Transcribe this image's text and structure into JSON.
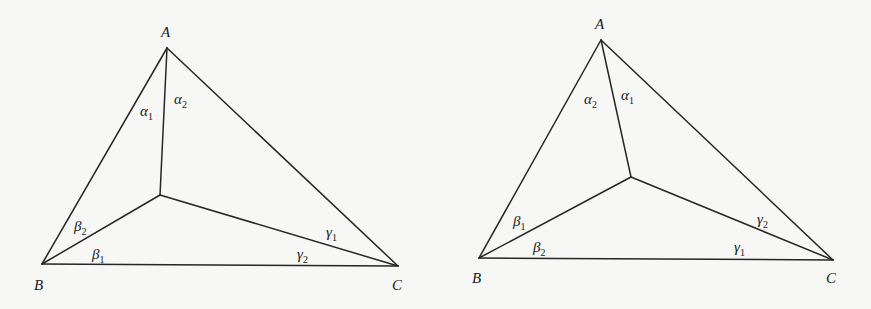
{
  "figures": [
    {
      "id": "left",
      "vertices": {
        "A": {
          "label": "A",
          "x": 167,
          "y": 48
        },
        "B": {
          "label": "B",
          "x": 42,
          "y": 264
        },
        "C": {
          "label": "C",
          "x": 398,
          "y": 266
        }
      },
      "interior_point": {
        "x": 160,
        "y": 195
      },
      "angles": [
        {
          "sym": "α",
          "sub": "1",
          "x": 140,
          "y": 116
        },
        {
          "sym": "α",
          "sub": "2",
          "x": 174,
          "y": 104
        },
        {
          "sym": "β",
          "sub": "2",
          "x": 74,
          "y": 231
        },
        {
          "sym": "β",
          "sub": "1",
          "x": 92,
          "y": 259
        },
        {
          "sym": "γ",
          "sub": "1",
          "x": 326,
          "y": 237
        },
        {
          "sym": "γ",
          "sub": "2",
          "x": 297,
          "y": 259
        }
      ],
      "vertex_label_pos": {
        "A": {
          "x": 161,
          "y": 37
        },
        "B": {
          "x": 34,
          "y": 290
        },
        "C": {
          "x": 392,
          "y": 290
        }
      }
    },
    {
      "id": "right",
      "vertices": {
        "A": {
          "label": "A",
          "x": 601,
          "y": 40
        },
        "B": {
          "label": "B",
          "x": 479,
          "y": 258
        },
        "C": {
          "label": "C",
          "x": 833,
          "y": 260
        }
      },
      "interior_point": {
        "x": 631,
        "y": 177
      },
      "angles": [
        {
          "sym": "α",
          "sub": "2",
          "x": 584,
          "y": 104
        },
        {
          "sym": "α",
          "sub": "1",
          "x": 621,
          "y": 100
        },
        {
          "sym": "β",
          "sub": "1",
          "x": 513,
          "y": 226
        },
        {
          "sym": "β",
          "sub": "2",
          "x": 533,
          "y": 252
        },
        {
          "sym": "γ",
          "sub": "2",
          "x": 757,
          "y": 224
        },
        {
          "sym": "γ",
          "sub": "1",
          "x": 734,
          "y": 252
        }
      ],
      "vertex_label_pos": {
        "A": {
          "x": 595,
          "y": 29
        },
        "B": {
          "x": 472,
          "y": 283
        },
        "C": {
          "x": 826,
          "y": 283
        }
      }
    }
  ]
}
